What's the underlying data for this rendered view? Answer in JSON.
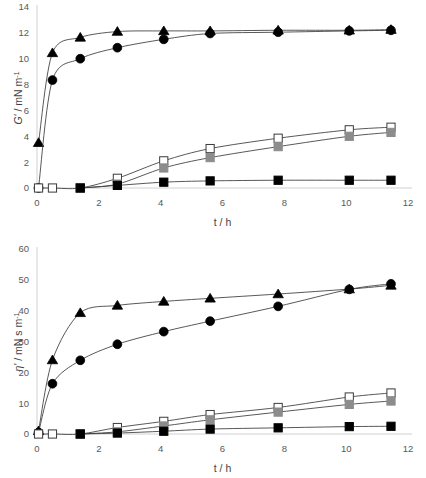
{
  "figure": {
    "background": "#ffffff",
    "panels": [
      "top",
      "bottom"
    ]
  },
  "chart_data": [
    {
      "id": "panel-top",
      "type": "line",
      "title": "",
      "xlabel": "t / h",
      "ylabel": "G' / mN m-1",
      "ylabel_symbol": "G'",
      "ylabel_units": "/ mN m",
      "ylabel_exponent": "-1",
      "xlim": [
        0,
        12
      ],
      "ylim": [
        0,
        14
      ],
      "xticks": [
        0,
        2,
        4,
        6,
        8,
        10,
        12
      ],
      "yticks": [
        0,
        2,
        4,
        6,
        8,
        10,
        12,
        14
      ],
      "grid": false,
      "legend": "none",
      "series": [
        {
          "name": "filled-triangle",
          "marker": "triangle",
          "fill": "#000000",
          "stroke": "#000000",
          "x": [
            0.05,
            0.5,
            1.4,
            2.6,
            4.1,
            5.6,
            7.8,
            10.1,
            11.45
          ],
          "values": [
            3.5,
            10.45,
            11.65,
            12.1,
            12.15,
            12.15,
            12.2,
            12.2,
            12.25
          ]
        },
        {
          "name": "filled-circle",
          "marker": "circle",
          "fill": "#000000",
          "stroke": "#000000",
          "x": [
            0.05,
            0.5,
            1.4,
            2.6,
            4.1,
            5.6,
            7.8,
            10.1,
            11.45
          ],
          "values": [
            0.0,
            8.35,
            10.0,
            10.85,
            11.5,
            11.95,
            12.05,
            12.15,
            12.2
          ]
        },
        {
          "name": "open-square",
          "marker": "square",
          "fill": "#ffffff",
          "stroke": "#3a3a3a",
          "x": [
            0.05,
            0.5,
            1.4,
            2.6,
            4.1,
            5.6,
            7.8,
            10.1,
            11.45
          ],
          "values": [
            0.0,
            0.0,
            0.0,
            0.75,
            2.1,
            3.05,
            3.85,
            4.5,
            4.7
          ]
        },
        {
          "name": "gray-square",
          "marker": "square",
          "fill": "#8c8c8c",
          "stroke": "#8c8c8c",
          "x": [
            1.4,
            2.6,
            4.1,
            5.6,
            7.8,
            10.1,
            11.45
          ],
          "values": [
            0.0,
            0.3,
            1.55,
            2.35,
            3.2,
            4.0,
            4.3
          ]
        },
        {
          "name": "filled-square",
          "marker": "square",
          "fill": "#000000",
          "stroke": "#000000",
          "x": [
            1.4,
            2.6,
            4.1,
            5.6,
            7.8,
            10.1,
            11.45
          ],
          "values": [
            0.0,
            0.2,
            0.45,
            0.55,
            0.6,
            0.6,
            0.6
          ]
        }
      ]
    },
    {
      "id": "panel-bottom",
      "type": "line",
      "title": "",
      "xlabel": "t / h",
      "ylabel": "eta' / mN s m-1",
      "ylabel_symbol": "η'",
      "ylabel_units": "/ mN s m",
      "ylabel_exponent": "-1",
      "xlim": [
        0,
        12
      ],
      "ylim": [
        0,
        60
      ],
      "xticks": [
        0,
        2,
        4,
        6,
        8,
        10,
        12
      ],
      "yticks": [
        0,
        10,
        20,
        30,
        40,
        50,
        60
      ],
      "grid": false,
      "legend": "none",
      "series": [
        {
          "name": "filled-triangle",
          "marker": "triangle",
          "fill": "#000000",
          "stroke": "#000000",
          "x": [
            0.05,
            0.5,
            1.4,
            2.6,
            4.1,
            5.6,
            7.8,
            10.1,
            11.45
          ],
          "values": [
            1.0,
            24.0,
            39.3,
            41.7,
            43.0,
            44.0,
            45.4,
            47.0,
            48.2
          ]
        },
        {
          "name": "filled-circle",
          "marker": "circle",
          "fill": "#000000",
          "stroke": "#000000",
          "x": [
            0.05,
            0.5,
            1.4,
            2.6,
            4.1,
            5.6,
            7.8,
            10.1,
            11.45
          ],
          "values": [
            0.5,
            16.3,
            23.9,
            29.1,
            33.2,
            36.6,
            41.4,
            46.9,
            48.7
          ]
        },
        {
          "name": "open-square",
          "marker": "square",
          "fill": "#ffffff",
          "stroke": "#3a3a3a",
          "x": [
            0.05,
            0.5,
            1.4,
            2.6,
            4.1,
            5.6,
            7.8,
            10.1,
            11.45
          ],
          "values": [
            0.0,
            0.0,
            0.0,
            2.1,
            4.1,
            6.3,
            8.6,
            12.0,
            13.3
          ]
        },
        {
          "name": "gray-square",
          "marker": "square",
          "fill": "#8c8c8c",
          "stroke": "#8c8c8c",
          "x": [
            1.4,
            2.6,
            4.1,
            5.6,
            7.8,
            10.1,
            11.45
          ],
          "values": [
            0.0,
            0.7,
            2.6,
            4.6,
            7.1,
            9.6,
            10.7
          ]
        },
        {
          "name": "filled-square",
          "marker": "square",
          "fill": "#000000",
          "stroke": "#000000",
          "x": [
            1.4,
            2.6,
            4.1,
            5.6,
            7.8,
            10.1,
            11.45
          ],
          "values": [
            0.0,
            0.3,
            0.9,
            1.6,
            2.0,
            2.4,
            2.5
          ]
        }
      ]
    }
  ]
}
